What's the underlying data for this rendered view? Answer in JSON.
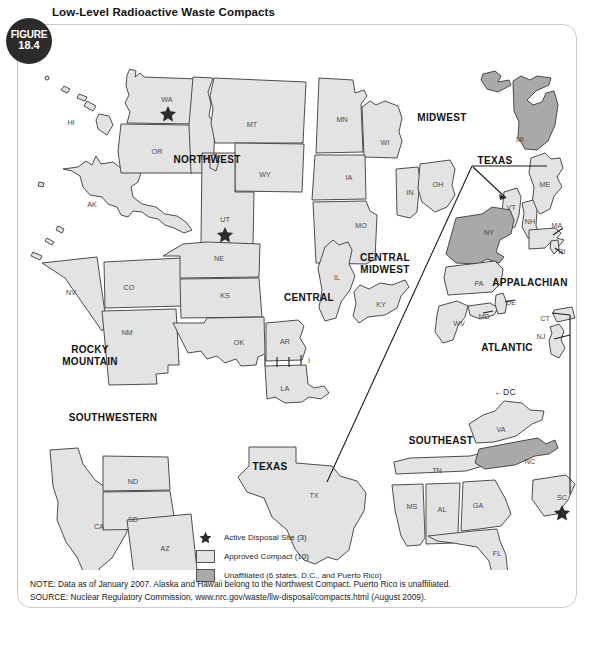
{
  "figure": {
    "badge_label": "FIGURE",
    "badge_number": "18.4",
    "title": "Low-Level Radioactive Waste Compacts"
  },
  "legend": {
    "items": [
      {
        "symbol": "star",
        "label": "Active Disposal Site (3)"
      },
      {
        "symbol": "compact-swatch",
        "label": "Approved Compact (10)"
      },
      {
        "symbol": "unaffiliated-swatch",
        "label": "Unaffiliated (6 states, D.C., and Puerto Rico)"
      }
    ]
  },
  "notes": {
    "note": "NOTE: Data as of January 2007. Alaska and Hawaii belong to the Northwest Compact. Puerto Rico is unaffiliated.",
    "source": "SOURCE: Nuclear Regulatory Commission, www.nrc.gov/waste/llw-disposal/compacts.html (August 2009)."
  },
  "colors": {
    "compact_fill": "#e3e3e3",
    "unaffiliated_fill": "#a9a9a9",
    "outline": "#3a3a3a",
    "badge_bg": "#2b2b2b"
  },
  "map": {
    "region_labels": [
      {
        "name": "NORTHWEST",
        "x": 190,
        "y": 130
      },
      {
        "name": "MIDWEST",
        "x": 425,
        "y": 88
      },
      {
        "name": "CENTRAL MIDWEST",
        "x": 368,
        "y": 228
      },
      {
        "name": "CENTRAL",
        "x": 292,
        "y": 268
      },
      {
        "name": "ROCKY MOUNTAIN",
        "x": 73,
        "y": 320
      },
      {
        "name": "SOUTHWESTERN",
        "x": 96,
        "y": 388
      },
      {
        "name": "TEXAS",
        "x": 253,
        "y": 437
      },
      {
        "name": "TEXAS",
        "x": 478,
        "y": 131
      },
      {
        "name": "APPALACHIAN",
        "x": 513,
        "y": 253
      },
      {
        "name": "ATLANTIC",
        "x": 490,
        "y": 318
      },
      {
        "name": "SOUTHEAST",
        "x": 424,
        "y": 411
      }
    ],
    "dc_marker": "←DC",
    "state_labels": [
      {
        "code": "HI",
        "x": 54,
        "y": 93,
        "group": "northwest"
      },
      {
        "code": "AK",
        "x": 75,
        "y": 175,
        "group": "northwest"
      },
      {
        "code": "WA",
        "x": 150,
        "y": 70,
        "group": "northwest"
      },
      {
        "code": "OR",
        "x": 140,
        "y": 122,
        "group": "northwest"
      },
      {
        "code": "ID",
        "x": 187,
        "y": 128,
        "group": "northwest"
      },
      {
        "code": "MT",
        "x": 235,
        "y": 95,
        "group": "northwest"
      },
      {
        "code": "WY",
        "x": 248,
        "y": 145,
        "group": "northwest"
      },
      {
        "code": "UT",
        "x": 208,
        "y": 190,
        "group": "northwest"
      },
      {
        "code": "MN",
        "x": 325,
        "y": 90,
        "group": "midwest"
      },
      {
        "code": "WI",
        "x": 368,
        "y": 113,
        "group": "midwest"
      },
      {
        "code": "IA",
        "x": 332,
        "y": 148,
        "group": "midwest"
      },
      {
        "code": "MO",
        "x": 344,
        "y": 196,
        "group": "midwest"
      },
      {
        "code": "IN",
        "x": 393,
        "y": 163,
        "group": "midwest"
      },
      {
        "code": "OH",
        "x": 421,
        "y": 155,
        "group": "midwest"
      },
      {
        "code": "MI",
        "x": 503,
        "y": 110,
        "group": "unaffiliated"
      },
      {
        "code": "IL",
        "x": 320,
        "y": 248,
        "group": "central-midwest"
      },
      {
        "code": "KY",
        "x": 364,
        "y": 275,
        "group": "central-midwest"
      },
      {
        "code": "NV",
        "x": 54,
        "y": 263,
        "group": "rocky-mountain"
      },
      {
        "code": "CO",
        "x": 112,
        "y": 258,
        "group": "rocky-mountain"
      },
      {
        "code": "NM",
        "x": 110,
        "y": 303,
        "group": "rocky-mountain"
      },
      {
        "code": "NE",
        "x": 202,
        "y": 229,
        "group": "central"
      },
      {
        "code": "KS",
        "x": 208,
        "y": 266,
        "group": "central"
      },
      {
        "code": "OK",
        "x": 222,
        "y": 313,
        "group": "central"
      },
      {
        "code": "AR",
        "x": 268,
        "y": 312,
        "group": "central"
      },
      {
        "code": "LA",
        "x": 268,
        "y": 359,
        "group": "central"
      },
      {
        "code": "CA",
        "x": 82,
        "y": 497,
        "group": "southwestern"
      },
      {
        "code": "ND",
        "x": 116,
        "y": 452,
        "group": "southwestern"
      },
      {
        "code": "SD",
        "x": 116,
        "y": 490,
        "group": "southwestern"
      },
      {
        "code": "AZ",
        "x": 148,
        "y": 519,
        "group": "southwestern"
      },
      {
        "code": "TX",
        "x": 297,
        "y": 466,
        "group": "texas"
      },
      {
        "code": "VT",
        "x": 494,
        "y": 178,
        "group": "texas"
      },
      {
        "code": "ME",
        "x": 528,
        "y": 155,
        "group": "unaffiliated"
      },
      {
        "code": "NH",
        "x": 513,
        "y": 192,
        "group": "unaffiliated"
      },
      {
        "code": "NY",
        "x": 472,
        "y": 203,
        "group": "unaffiliated"
      },
      {
        "code": "MA",
        "x": 540,
        "y": 196,
        "group": "unaffiliated"
      },
      {
        "code": "RI",
        "x": 545,
        "y": 222,
        "group": "unaffiliated"
      },
      {
        "code": "PA",
        "x": 462,
        "y": 254,
        "group": "appalachian"
      },
      {
        "code": "WV",
        "x": 442,
        "y": 294,
        "group": "appalachian"
      },
      {
        "code": "MD",
        "x": 467,
        "y": 287,
        "group": "appalachian"
      },
      {
        "code": "DE",
        "x": 494,
        "y": 273,
        "group": "appalachian"
      },
      {
        "code": "CT",
        "x": 528,
        "y": 289,
        "group": "atlantic"
      },
      {
        "code": "NJ",
        "x": 524,
        "y": 307,
        "group": "atlantic"
      },
      {
        "code": "VA",
        "x": 484,
        "y": 400,
        "group": "southeast"
      },
      {
        "code": "TN",
        "x": 420,
        "y": 441,
        "group": "southeast"
      },
      {
        "code": "MS",
        "x": 395,
        "y": 477,
        "group": "southeast"
      },
      {
        "code": "AL",
        "x": 425,
        "y": 480,
        "group": "southeast"
      },
      {
        "code": "GA",
        "x": 461,
        "y": 476,
        "group": "southeast"
      },
      {
        "code": "FL",
        "x": 480,
        "y": 524,
        "group": "southeast"
      },
      {
        "code": "NC",
        "x": 513,
        "y": 432,
        "group": "unaffiliated"
      },
      {
        "code": "SC",
        "x": 545,
        "y": 468,
        "group": "southeast"
      }
    ],
    "disposal_sites": [
      {
        "state": "WA",
        "x": 151,
        "y": 83
      },
      {
        "state": "UT",
        "x": 208,
        "y": 204
      },
      {
        "state": "SC",
        "x": 545,
        "y": 482
      }
    ]
  }
}
